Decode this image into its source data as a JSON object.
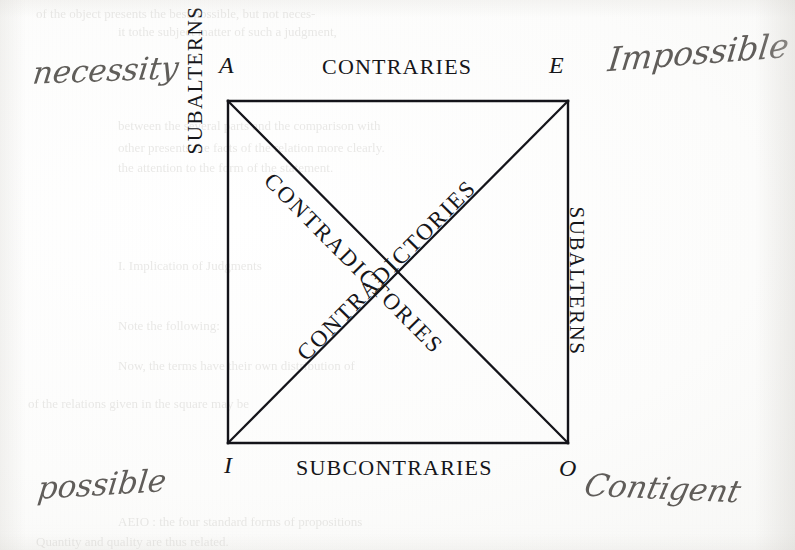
{
  "diagram": {
    "relations": {
      "top": "CONTRARIES",
      "bottom": "SUBCONTRARIES",
      "left": "SUBALTERNS",
      "right": "SUBALTERNS",
      "diagonal_down": "CONTRADICTORIES",
      "diagonal_up": "CONTRADICTORIES"
    },
    "corners": {
      "top_left": "A",
      "top_right": "E",
      "bottom_left": "I",
      "bottom_right": "O"
    },
    "geometry": {
      "left": 228,
      "top": 101,
      "right": 568,
      "bottom": 443,
      "stroke_color": "#14141a",
      "stroke_width": 2.4
    }
  },
  "annotations": {
    "top_left": "necessity",
    "top_right": "Impossible",
    "bottom_left": "possible",
    "bottom_right": "Contigent",
    "ink_color": "#55524e"
  },
  "showthrough": {
    "lines": [
      {
        "text": "of the object presents the best possible, but not neces-",
        "x": 36,
        "y": 6,
        "size": 13
      },
      {
        "text": "it tothe subject matter of such a judgment,",
        "x": 118,
        "y": 24,
        "size": 13
      },
      {
        "text": "between the several parts and the comparison with",
        "x": 118,
        "y": 118,
        "size": 13
      },
      {
        "text": "other presents the facts of the relation more clearly.",
        "x": 118,
        "y": 140,
        "size": 13
      },
      {
        "text": "the attention to the form of the statement.",
        "x": 118,
        "y": 160,
        "size": 13
      },
      {
        "text": "I. Implication of Judgments",
        "x": 118,
        "y": 258,
        "size": 13
      },
      {
        "text": "Note the following:",
        "x": 118,
        "y": 318,
        "size": 13
      },
      {
        "text": "Now, the terms have their own distribution of",
        "x": 118,
        "y": 358,
        "size": 13
      },
      {
        "text": "of the relations given in the square may be",
        "x": 28,
        "y": 396,
        "size": 13
      },
      {
        "text": "AEIO : the four standard forms of propositions",
        "x": 118,
        "y": 514,
        "size": 13
      },
      {
        "text": "Quantity and quality are thus related.",
        "x": 36,
        "y": 534,
        "size": 13
      }
    ]
  }
}
